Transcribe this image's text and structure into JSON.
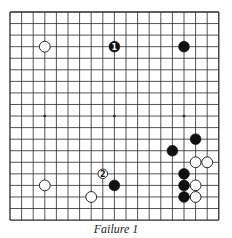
{
  "diagram": {
    "type": "go-board",
    "size": 19,
    "grid": {
      "origin_x": 10,
      "origin_y": 12,
      "spacing_x": 11.6,
      "spacing_y": 11.56
    },
    "colors": {
      "line": "#2a2a2a",
      "black_stone": "#111111",
      "white_stone": "#ffffff",
      "stone_outline": "#111111"
    },
    "star_points": [
      {
        "col": 3,
        "row": 9
      },
      {
        "col": 9,
        "row": 9
      },
      {
        "col": 15,
        "row": 9
      }
    ],
    "stones": [
      {
        "color": "white",
        "col": 3,
        "row": 3,
        "label": ""
      },
      {
        "color": "black",
        "col": 9,
        "row": 3,
        "label": "1"
      },
      {
        "color": "black",
        "col": 15,
        "row": 3,
        "label": ""
      },
      {
        "color": "black",
        "col": 16,
        "row": 11,
        "label": ""
      },
      {
        "color": "black",
        "col": 14,
        "row": 12,
        "label": ""
      },
      {
        "color": "white",
        "col": 16,
        "row": 13,
        "label": ""
      },
      {
        "color": "white",
        "col": 17,
        "row": 13,
        "label": ""
      },
      {
        "color": "white",
        "col": 8,
        "row": 14,
        "label": "2"
      },
      {
        "color": "black",
        "col": 15,
        "row": 14,
        "label": ""
      },
      {
        "color": "white",
        "col": 3,
        "row": 15,
        "label": ""
      },
      {
        "color": "black",
        "col": 9,
        "row": 15,
        "label": ""
      },
      {
        "color": "black",
        "col": 15,
        "row": 15,
        "label": ""
      },
      {
        "color": "white",
        "col": 16,
        "row": 15,
        "label": ""
      },
      {
        "color": "white",
        "col": 7,
        "row": 16,
        "label": ""
      },
      {
        "color": "black",
        "col": 15,
        "row": 16,
        "label": ""
      },
      {
        "color": "white",
        "col": 16,
        "row": 16,
        "label": ""
      }
    ]
  },
  "caption": "Failure 1"
}
